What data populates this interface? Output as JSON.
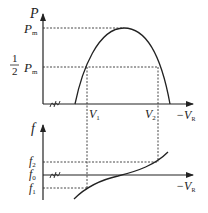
{
  "top_chart": {
    "y_axis_label": "P",
    "y_ticks": [
      {
        "label": "P",
        "sub": "m",
        "prefix": ""
      },
      {
        "label": "P",
        "sub": "m",
        "prefix": "1/2"
      }
    ],
    "x_axis_label": "−V",
    "x_axis_label_sub": "R",
    "x_marks": [
      {
        "label": "V",
        "sub": "1"
      },
      {
        "label": "V",
        "sub": "2"
      }
    ],
    "half_num": "1",
    "half_den": "2"
  },
  "bottom_chart": {
    "y_axis_label": "f",
    "y_ticks": [
      {
        "label": "f",
        "sub": "2"
      },
      {
        "label": "f",
        "sub": "0"
      },
      {
        "label": "f",
        "sub": "1"
      }
    ],
    "x_axis_label": "−V",
    "x_axis_label_sub": "R"
  },
  "colors": {
    "line": "#222222",
    "dotted": "#333333"
  }
}
